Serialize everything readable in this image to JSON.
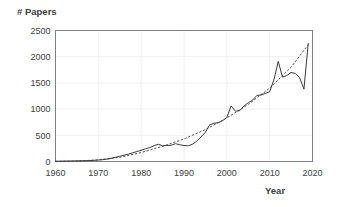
{
  "chart_data": {
    "type": "line",
    "title": "",
    "xlabel": "Year",
    "ylabel": "# Papers",
    "xlim": [
      1960,
      2020
    ],
    "ylim": [
      0,
      2500
    ],
    "xticks": [
      1960,
      1970,
      1980,
      1990,
      2000,
      2010,
      2020
    ],
    "yticks": [
      0,
      500,
      1000,
      1500,
      2000,
      2500
    ],
    "grid": true,
    "legend": "none",
    "colors": {
      "series": "#3a3a3a",
      "trend": "#3a3a3a",
      "grid": "#ececec",
      "border": "#808080",
      "text": "#3d3d3d"
    },
    "series": [
      {
        "name": "# Papers",
        "style": "solid",
        "x": [
          1960,
          1961,
          1962,
          1963,
          1964,
          1965,
          1966,
          1967,
          1968,
          1969,
          1970,
          1971,
          1972,
          1973,
          1974,
          1975,
          1976,
          1977,
          1978,
          1979,
          1980,
          1981,
          1982,
          1983,
          1984,
          1985,
          1986,
          1987,
          1988,
          1989,
          1990,
          1991,
          1992,
          1993,
          1994,
          1995,
          1996,
          1997,
          1998,
          1999,
          2000,
          2001,
          2002,
          2003,
          2004,
          2005,
          2006,
          2007,
          2008,
          2009,
          2010,
          2011,
          2012,
          2013,
          2014,
          2015,
          2016,
          2017,
          2018,
          2019
        ],
        "values": [
          5,
          6,
          8,
          8,
          10,
          12,
          14,
          16,
          18,
          22,
          28,
          35,
          45,
          60,
          80,
          100,
          120,
          140,
          165,
          190,
          215,
          240,
          265,
          300,
          330,
          300,
          305,
          310,
          340,
          320,
          305,
          300,
          330,
          390,
          470,
          560,
          700,
          730,
          740,
          780,
          840,
          1060,
          960,
          970,
          1060,
          1120,
          1170,
          1260,
          1270,
          1300,
          1330,
          1560,
          1910,
          1610,
          1640,
          1700,
          1680,
          1600,
          1380,
          2250
        ]
      },
      {
        "name": "Trend",
        "style": "dashed",
        "x": [
          1960,
          1965,
          1970,
          1975,
          1980,
          1985,
          1990,
          1995,
          2000,
          2005,
          2010,
          2015,
          2019
        ],
        "values": [
          2,
          10,
          30,
          80,
          170,
          290,
          430,
          610,
          830,
          1090,
          1400,
          1800,
          2230
        ]
      }
    ]
  },
  "labels": {
    "y_axis_title": "# Papers",
    "x_axis_title": "Year",
    "y_ticks": [
      "2500",
      "2000",
      "1500",
      "1000",
      "500",
      "0"
    ],
    "x_ticks": [
      "1960",
      "1970",
      "1980",
      "1990",
      "2000",
      "2010",
      "2020"
    ]
  }
}
